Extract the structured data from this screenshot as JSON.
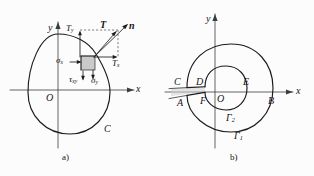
{
  "figure": {
    "background_color": "#fcfcfc",
    "ink_color": "#1b1b1b",
    "panels": [
      {
        "id": "a",
        "caption": "a)",
        "description": "Closed contour C in the xy-plane with traction vector T and unit normal n at a boundary point, resolved into components Tx, Ty, and with stress components sigma_x, sigma_y, tau_xy on an interior element",
        "axes": {
          "x_label": "x",
          "y_label": "y",
          "origin_label": "O"
        },
        "curve_label": "C",
        "labels": {
          "traction": "T",
          "normal": "n",
          "traction_x": "T",
          "traction_x_sub": "x",
          "traction_y": "T",
          "traction_y_sub": "y",
          "sigma_x": "σ",
          "sigma_x_sub": "x",
          "sigma_y": "σ",
          "sigma_y_sub": "y",
          "tau_xy": "τ",
          "tau_xy_sub": "xy"
        }
      },
      {
        "id": "b",
        "caption": "b)",
        "description": "Doubly-connected region bounded by outer contour Gamma-1 and inner contour Gamma-2, joined by a narrow cut; points A, B, C, D, E, F mark the cut edges and axis intersections",
        "axes": {
          "x_label": "x",
          "y_label": "y",
          "origin_label": "O"
        },
        "contours": [
          {
            "name": "Γ",
            "sub": "1",
            "role": "outer-contour"
          },
          {
            "name": "Γ",
            "sub": "2",
            "role": "inner-contour"
          }
        ],
        "points": [
          "A",
          "B",
          "C",
          "D",
          "E",
          "F"
        ]
      }
    ]
  }
}
